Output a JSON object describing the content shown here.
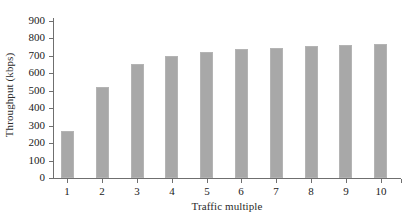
{
  "chart_data": {
    "type": "bar",
    "title": "",
    "xlabel": "Traffic multiple",
    "ylabel": "Throughput (kbps)",
    "categories": [
      "1",
      "2",
      "3",
      "4",
      "5",
      "6",
      "7",
      "8",
      "9",
      "10"
    ],
    "values": [
      268,
      521,
      653,
      700,
      723,
      741,
      748,
      757,
      763,
      768
    ],
    "ylim": [
      0,
      900
    ],
    "ytick_labels": [
      "900",
      "800",
      "700",
      "600",
      "500",
      "400",
      "300",
      "200",
      "100",
      "0"
    ],
    "ytick_values": [
      900,
      800,
      700,
      600,
      500,
      400,
      300,
      200,
      100,
      0
    ],
    "grid": false,
    "legend": "none",
    "series_color": "#a8a8a8",
    "axis_color": "#6f6f6f",
    "background": "#ffffff"
  }
}
